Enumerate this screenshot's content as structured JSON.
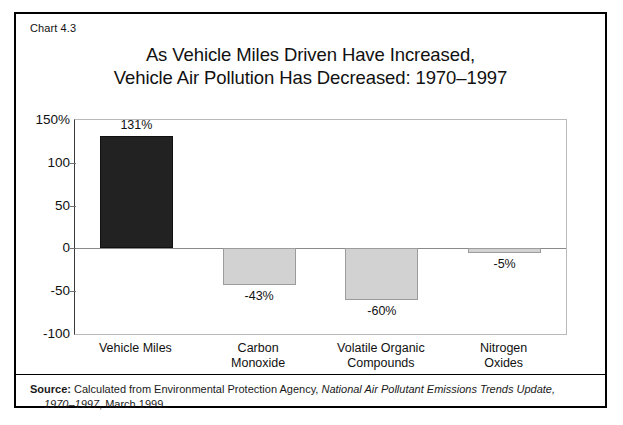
{
  "figure": {
    "chart_number": "Chart 4.3",
    "title_line_1": "As Vehicle Miles Driven Have Increased,",
    "title_line_2": "Vehicle Air Pollution Has Decreased: 1970–1997"
  },
  "source": {
    "label": "Source:",
    "text_before_italic": " Calculated from Environmental Protection Agency, ",
    "italic_title": "National Air Pollutant Emissions Trends Update,",
    "italic_years": "1970–1997",
    "text_after_italic": ", March 1999."
  },
  "colors": {
    "bar_increase": "#222222",
    "bar_decrease": "#d2d2d2",
    "frame": "#000000",
    "axis": "#3a3a3a",
    "zero_line": "#8a8a8a"
  },
  "chart_data": {
    "type": "bar",
    "title": "As Vehicle Miles Driven Have Increased, Vehicle Air Pollution Has Decreased: 1970–1997",
    "xlabel": "",
    "ylabel": "",
    "categories": [
      "Vehicle Miles",
      "Carbon Monoxide",
      "Volatile Organic Compounds",
      "Nitrogen Oxides"
    ],
    "category_lines": [
      [
        "Vehicle Miles"
      ],
      [
        "Carbon",
        "Monoxide"
      ],
      [
        "Volatile Organic",
        "Compounds"
      ],
      [
        "Nitrogen",
        "Oxides"
      ]
    ],
    "values": [
      131,
      -43,
      -60,
      -5
    ],
    "data_labels": [
      "131%",
      "-43%",
      "-60%",
      "-5%"
    ],
    "ylim": [
      -100,
      150
    ],
    "yticks": [
      150,
      100,
      50,
      0,
      -50,
      -100
    ],
    "ytick_labels": [
      "150%",
      "100",
      "50",
      "0",
      "-50",
      "-100"
    ],
    "grid": false,
    "legend": false
  }
}
